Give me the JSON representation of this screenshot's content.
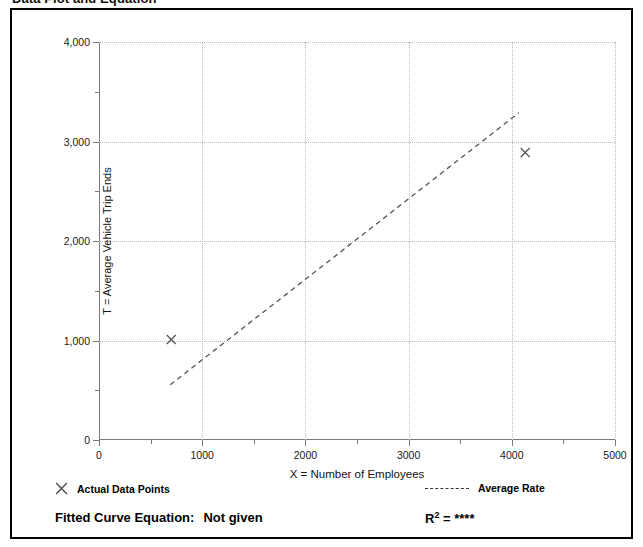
{
  "page_title": "Data Plot and Equation",
  "chart_data": {
    "type": "scatter",
    "title": "",
    "xlabel": "X = Number of Employees",
    "ylabel": "T = Average Vehicle Trip Ends",
    "xlim": [
      0,
      5000
    ],
    "ylim": [
      0,
      4000
    ],
    "xticks": [
      0,
      1000,
      2000,
      3000,
      4000,
      5000
    ],
    "xtick_labels": [
      "0",
      "1000",
      "2000",
      "3000",
      "4000",
      "5000"
    ],
    "yticks": [
      0,
      1000,
      2000,
      3000,
      4000
    ],
    "ytick_labels": [
      "0",
      "1,000",
      "2,000",
      "3,000",
      "4,000"
    ],
    "minor_xticks": [
      500,
      1500,
      2500,
      3500,
      4500
    ],
    "minor_yticks": [
      500,
      1500,
      2500,
      3500
    ],
    "grid": "dotted-both",
    "legend_position": "below-plot",
    "series": [
      {
        "name": "Actual Data Points",
        "type": "scatter",
        "marker": "x",
        "color": "#555555",
        "points": [
          {
            "x": 700,
            "y": 1010
          },
          {
            "x": 4130,
            "y": 2890
          }
        ]
      },
      {
        "name": "Average Rate",
        "type": "line",
        "style": "dashed",
        "color": "#555555",
        "points": [
          {
            "x": 690,
            "y": 555
          },
          {
            "x": 4070,
            "y": 3290
          }
        ]
      }
    ]
  },
  "legend": {
    "data_points_label": "Actual Data Points",
    "average_rate_label": "Average Rate",
    "fitted_curve_label": "Fitted Curve Equation:",
    "fitted_curve_value": "Not given",
    "r2_label": "R",
    "r2_exponent": "2",
    "r2_equals": "=",
    "r2_value": "****"
  },
  "colors": {
    "frame": "#000000",
    "axis": "#7a7a7a",
    "grid": "#b9b9b9",
    "data": "#555555",
    "text": "#000000"
  }
}
